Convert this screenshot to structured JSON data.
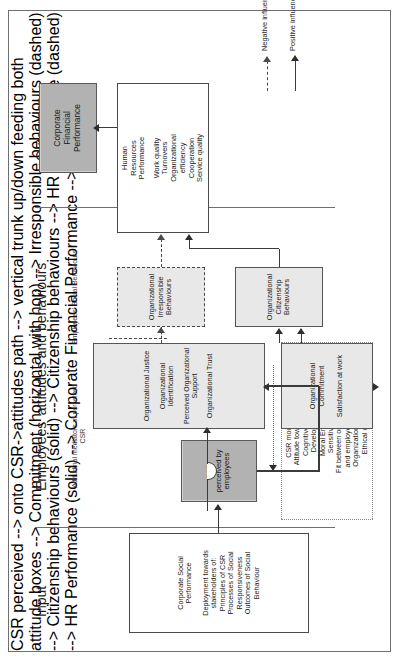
{
  "figure": {
    "orientation": "rotated-90-ccw",
    "sections": [
      {
        "name": "input",
        "label": "Input"
      },
      {
        "name": "attitudes",
        "label": "Employees' attitudes and behaviours"
      },
      {
        "name": "outcomes",
        "label": "Outcomes"
      }
    ],
    "sub_labels": [
      {
        "name": "attitudinal-mediators",
        "text": "Attitudinal mediators of perceived CSR"
      },
      {
        "name": "employees-social-behaviours",
        "text": "Employees' Social Behaviours"
      }
    ],
    "nodes": {
      "input_csp": {
        "lines": [
          "Corporate Social",
          "Performance",
          "",
          "Deployment towards",
          "stakeholders of:",
          "Principles of CSR",
          "Processes of Social",
          "Responsiveness",
          "Outcomes of Social",
          "Behaviour"
        ]
      },
      "csr_perceived": {
        "lines": [
          "CSR",
          "perceived by",
          "employees"
        ]
      },
      "csr_moderators": {
        "lines": [
          "CSR moderators",
          "Attitude towards CSR",
          "Cognitive Moral",
          "Development",
          "Moral Emotions",
          "Sensitiveness",
          "Fit between organizational",
          "and employees' values",
          "Organizational Culture",
          "Ethical climate"
        ]
      },
      "attitudinal_mediators": {
        "lines": [
          "Organizational Justice",
          "",
          "Organizational",
          "Identification",
          "",
          "Perceived Organizational",
          "Support",
          "",
          "Organizational Trust"
        ]
      },
      "commitment": {
        "lines": [
          "Organizational",
          "Commitment",
          "",
          "Satisfaction at work"
        ]
      },
      "irresponsible_behaviours": {
        "lines": [
          "Organizational",
          "Irresponsible",
          "Behaviours"
        ]
      },
      "citizenship_behaviours": {
        "lines": [
          "Organizational",
          "Citizenship",
          "Behaviours"
        ]
      },
      "hr_performance": {
        "lines": [
          "Human",
          "Resources",
          "Performance",
          "",
          "Work quality",
          "Turnovers",
          "Organizational",
          "efficiency",
          "Cooperation",
          "Service quality"
        ]
      },
      "corporate_financial_performance": {
        "lines": [
          "Corporate",
          "Financial",
          "Performance"
        ]
      }
    },
    "legend": [
      {
        "name": "negative-influence",
        "label": "Negative influence",
        "style": "dashed"
      },
      {
        "name": "positive-influence",
        "label": "Positive influence",
        "style": "solid"
      }
    ],
    "colors": {
      "shaded_dark": "#b2b2b2",
      "shaded_light": "#e8e8e8",
      "border": "#4a4a4a",
      "frame": "#6f6f6f",
      "text": "#1a1a1a"
    }
  }
}
